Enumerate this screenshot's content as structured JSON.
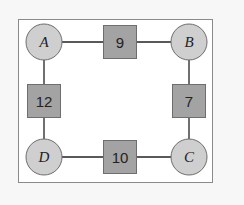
{
  "diagram": {
    "type": "weighted-graph",
    "colors": {
      "background": "#f7f7f7",
      "frame_fill": "#ffffff",
      "frame_stroke": "#8a8a8a",
      "node_fill": "#cfcfcf",
      "node_stroke": "#6e6e6e",
      "weight_fill": "#a3a3a3",
      "weight_stroke": "#6e6e6e",
      "edge": "#222222"
    },
    "nodes": [
      {
        "id": "A",
        "label": "A",
        "position": "top-left"
      },
      {
        "id": "B",
        "label": "B",
        "position": "top-right"
      },
      {
        "id": "C",
        "label": "C",
        "position": "bottom-right"
      },
      {
        "id": "D",
        "label": "D",
        "position": "bottom-left"
      }
    ],
    "edges": [
      {
        "from": "A",
        "to": "B",
        "weight": "9"
      },
      {
        "from": "B",
        "to": "C",
        "weight": "7"
      },
      {
        "from": "D",
        "to": "C",
        "weight": "10"
      },
      {
        "from": "A",
        "to": "D",
        "weight": "12"
      }
    ]
  }
}
